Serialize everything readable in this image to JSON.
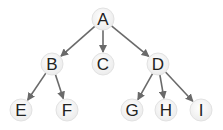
{
  "diagram": {
    "type": "tree",
    "colors": {
      "edge": "#6a6a6a",
      "node_fill": "#f4f4f4",
      "node_stroke": "#e2e2e2",
      "text": "#222222"
    },
    "nodes": [
      {
        "id": "A",
        "label": "A",
        "x": 103,
        "y": 19
      },
      {
        "id": "B",
        "label": "B",
        "x": 52,
        "y": 64
      },
      {
        "id": "C",
        "label": "C",
        "x": 103,
        "y": 64
      },
      {
        "id": "D",
        "label": "D",
        "x": 158,
        "y": 64
      },
      {
        "id": "E",
        "label": "E",
        "x": 21,
        "y": 110
      },
      {
        "id": "F",
        "label": "F",
        "x": 67,
        "y": 110
      },
      {
        "id": "G",
        "label": "G",
        "x": 132,
        "y": 110
      },
      {
        "id": "H",
        "label": "H",
        "x": 166,
        "y": 110
      },
      {
        "id": "I",
        "label": "I",
        "x": 201,
        "y": 110
      }
    ],
    "edges": [
      {
        "from": "A",
        "to": "B"
      },
      {
        "from": "A",
        "to": "C"
      },
      {
        "from": "A",
        "to": "D"
      },
      {
        "from": "B",
        "to": "E"
      },
      {
        "from": "B",
        "to": "F"
      },
      {
        "from": "D",
        "to": "G"
      },
      {
        "from": "D",
        "to": "H"
      },
      {
        "from": "D",
        "to": "I"
      }
    ]
  }
}
